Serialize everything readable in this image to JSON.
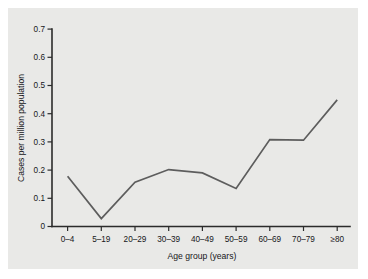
{
  "figure": {
    "background_color": "#ffffff",
    "panel_color": "#e9e9e7",
    "line_color": "#5d5d5d",
    "axis_color": "#2b2b2b"
  },
  "chart_data": {
    "type": "line",
    "title": "",
    "xlabel": "Age group (years)",
    "ylabel": "Cases per million population",
    "categories": [
      "0–4",
      "5–19",
      "20–29",
      "30–39",
      "40–49",
      "50–59",
      "60–69",
      "70–79",
      "≥80"
    ],
    "values": [
      0.178,
      0.028,
      0.157,
      0.202,
      0.19,
      0.135,
      0.308,
      0.306,
      0.449
    ],
    "series": [
      {
        "name": "Cases per million population",
        "values": [
          0.178,
          0.028,
          0.157,
          0.202,
          0.19,
          0.135,
          0.308,
          0.306,
          0.449
        ]
      }
    ],
    "ylim": [
      0,
      0.7
    ],
    "yticks": [
      0,
      0.1,
      0.2,
      0.3,
      0.4,
      0.5,
      0.6,
      0.7
    ],
    "ytick_labels": [
      "0",
      "0.1",
      "0.2",
      "0.3",
      "0.4",
      "0.5",
      "0.6",
      "0.7"
    ],
    "xtick_labels": [
      "0–4",
      "5–19",
      "20–29",
      "30–39",
      "40–49",
      "50–59",
      "60–69",
      "70–79",
      "≥80"
    ],
    "grid": false,
    "legend": false,
    "legend_position": "none"
  },
  "axes": {
    "y_title": "Cases per million population",
    "x_title": "Age group (years)"
  }
}
